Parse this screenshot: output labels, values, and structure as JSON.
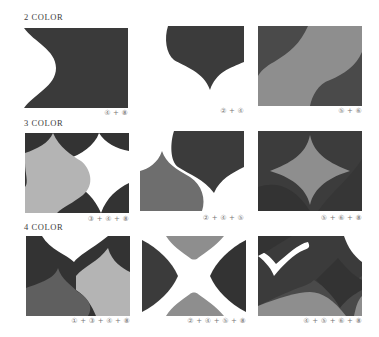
{
  "palette": {
    "c1": "#5f5f5f",
    "c2": "#6e6e6e",
    "c3": "#b4b4b4",
    "c4": "#3b3b3b",
    "c5": "#8e8e8e",
    "c6": "#4a4a4a",
    "c8": "#333333",
    "white": "#ffffff"
  },
  "sections": [
    {
      "title": "2 COLOR",
      "tiles": [
        {
          "caption": "④ + ⑧"
        },
        {
          "caption": "② + ④"
        },
        {
          "caption": "⑤ + ⑥"
        }
      ]
    },
    {
      "title": "3 COLOR",
      "tiles": [
        {
          "caption": "③ + ④ + ⑧"
        },
        {
          "caption": "② + ④ + ⑤"
        },
        {
          "caption": "⑤ + ⑥ + ⑧"
        }
      ]
    },
    {
      "title": "4 COLOR",
      "tiles": [
        {
          "caption": "① + ③ + ④ + ⑧"
        },
        {
          "caption": "② + ④ + ⑤ + ⑧"
        },
        {
          "caption": "④ + ⑤ + ⑥ + ⑧"
        }
      ]
    }
  ]
}
